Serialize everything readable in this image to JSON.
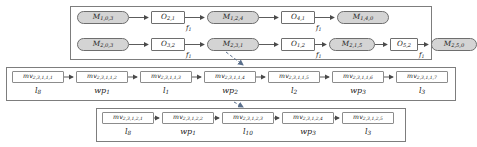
{
  "diagram": {
    "type": "process-routing-diagram",
    "colors": {
      "machine_fill": "#d4d4d4",
      "operation_fill": "#ffffff",
      "border": "#6e6e6e",
      "frame": "#7d7d7d",
      "dashed_arrow": "#5a6f8c",
      "text": "#1a1a1a"
    },
    "top_panel": {
      "name": "routing-panel",
      "rows": [
        {
          "name": "route-row-1",
          "nodes": [
            {
              "kind": "machine",
              "base": "M",
              "sub": "1,0,3"
            },
            {
              "kind": "operation",
              "base": "O",
              "sub": "2,1"
            },
            {
              "kind": "machine",
              "base": "M",
              "sub": "1,2,4"
            },
            {
              "kind": "operation",
              "base": "O",
              "sub": "4,1"
            },
            {
              "kind": "machine",
              "base": "M",
              "sub": "1,4,0"
            }
          ],
          "edge_tags": [
            {
              "base": "f",
              "sub": "1"
            },
            {
              "base": "f",
              "sub": "1"
            }
          ]
        },
        {
          "name": "route-row-2",
          "nodes": [
            {
              "kind": "machine",
              "base": "M",
              "sub": "2,0,3"
            },
            {
              "kind": "operation",
              "base": "O",
              "sub": "3,2"
            },
            {
              "kind": "machine",
              "base": "M",
              "sub": "2,3,1"
            },
            {
              "kind": "operation",
              "base": "O",
              "sub": "1,2"
            },
            {
              "kind": "machine",
              "base": "M",
              "sub": "2,1,5"
            },
            {
              "kind": "operation",
              "base": "O",
              "sub": "5,2"
            },
            {
              "kind": "machine",
              "base": "M",
              "sub": "2,5,0"
            }
          ],
          "edge_tags": [
            {
              "base": "f",
              "sub": "1"
            },
            {
              "base": "f",
              "sub": "1"
            },
            {
              "base": "f",
              "sub": "1"
            }
          ]
        }
      ]
    },
    "middle_panel": {
      "name": "move-sequence-panel-1",
      "boxes": [
        {
          "base": "mv",
          "sub": "2,3,1,1,1"
        },
        {
          "base": "mv",
          "sub": "2,3,1,1,2"
        },
        {
          "base": "mv",
          "sub": "2,3,1,1,3"
        },
        {
          "base": "mv",
          "sub": "2,3,1,1,4"
        },
        {
          "base": "mv",
          "sub": "2,3,1,1,5"
        },
        {
          "base": "mv",
          "sub": "2,3,1,1,6"
        },
        {
          "base": "mv",
          "sub": "2,3,1,1,7"
        }
      ],
      "labels": [
        {
          "base": "l",
          "sub": "8"
        },
        {
          "base": "wp",
          "sub": "1"
        },
        {
          "base": "l",
          "sub": "1"
        },
        {
          "base": "wp",
          "sub": "2"
        },
        {
          "base": "l",
          "sub": "2"
        },
        {
          "base": "wp",
          "sub": "3"
        },
        {
          "base": "l",
          "sub": "3"
        }
      ]
    },
    "bottom_panel": {
      "name": "move-sequence-panel-2",
      "boxes": [
        {
          "base": "mv",
          "sub": "2,3,1,2,1"
        },
        {
          "base": "mv",
          "sub": "2,3,1,2,2"
        },
        {
          "base": "mv",
          "sub": "2,3,1,2,3"
        },
        {
          "base": "mv",
          "sub": "2,3,1,2,4"
        },
        {
          "base": "mv",
          "sub": "2,3,1,2,5"
        }
      ],
      "labels": [
        {
          "base": "l",
          "sub": "8"
        },
        {
          "base": "wp",
          "sub": "1"
        },
        {
          "base": "l",
          "sub": "10"
        },
        {
          "base": "wp",
          "sub": "3"
        },
        {
          "base": "l",
          "sub": "3"
        }
      ]
    },
    "dashed_links": [
      {
        "name": "link-machine-to-move-1",
        "from": "M2,3,1",
        "to": "mv2,3,1,1,4"
      },
      {
        "name": "link-move-1-to-move-2",
        "from": "mv2,3,1,1,4",
        "to": "mv2,3,1,2,3"
      }
    ]
  }
}
